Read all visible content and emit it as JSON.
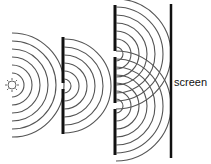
{
  "diagram": {
    "labels": {
      "screen": "screen"
    },
    "colors": {
      "wave": "#555555",
      "barrier": "#111111",
      "background": "#ffffff"
    },
    "source": {
      "icon": "light-source-icon",
      "cx": 12,
      "cy": 85
    },
    "barrier1": {
      "x": 63,
      "y_top": 37,
      "y_bottom": 134,
      "slits_y": [
        86
      ]
    },
    "barrier2": {
      "x": 115,
      "y_top": 5,
      "y_bottom": 155,
      "slits_y": [
        54,
        106
      ]
    },
    "screen": {
      "x": 171,
      "y_top": 4,
      "y_bottom": 158
    },
    "wave_radii": {
      "source": [
        12,
        20,
        28,
        36,
        44,
        52
      ],
      "slit1": [
        7,
        15,
        23,
        31,
        39,
        47
      ],
      "slit2": [
        7,
        15,
        23,
        31,
        39,
        47,
        55
      ]
    }
  }
}
